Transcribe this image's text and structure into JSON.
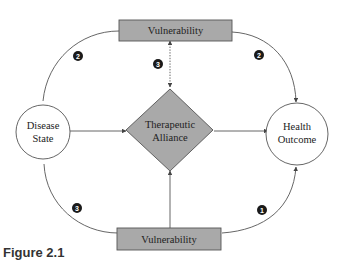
{
  "diagram": {
    "colors": {
      "box_fill": "#a9a9a9",
      "box_stroke": "#555555",
      "line": "#555555",
      "badge_fill": "#1a1a1a",
      "text": "#222222",
      "background": "#ffffff"
    },
    "nodes": {
      "vulnerability_top": {
        "label": "Vulnerability"
      },
      "vulnerability_bottom": {
        "label": "Vulnerability"
      },
      "disease_state": {
        "line1": "Disease",
        "line2": "State"
      },
      "health_outcome": {
        "line1": "Health",
        "line2": "Outcome"
      },
      "therapeutic_alliance": {
        "line1": "Therapeutic",
        "line2": "Alliance"
      }
    },
    "badges": {
      "top_left": "2",
      "top_right": "2",
      "center_dotted": "3",
      "bottom_left": "3",
      "bottom_right": "1"
    },
    "edges": [
      {
        "from": "Disease State",
        "to": "Vulnerability (top)",
        "style": "solid",
        "badge": "2"
      },
      {
        "from": "Vulnerability (top)",
        "to": "Health Outcome",
        "style": "solid-arrow",
        "badge": "2"
      },
      {
        "from": "Vulnerability (top)",
        "to": "Therapeutic Alliance",
        "style": "dotted-arrow",
        "badge": "3"
      },
      {
        "from": "Disease State",
        "to": "Therapeutic Alliance",
        "style": "solid-arrow"
      },
      {
        "from": "Therapeutic Alliance",
        "to": "Health Outcome",
        "style": "solid-arrow"
      },
      {
        "from": "Disease State",
        "to": "Vulnerability (bottom)",
        "style": "solid",
        "badge": "3"
      },
      {
        "from": "Vulnerability (bottom)",
        "to": "Therapeutic Alliance",
        "style": "solid-arrow"
      },
      {
        "from": "Vulnerability (bottom)",
        "to": "Health Outcome",
        "style": "solid-arrow",
        "badge": "1"
      }
    ]
  },
  "caption": {
    "text": "Figure 2.1"
  }
}
